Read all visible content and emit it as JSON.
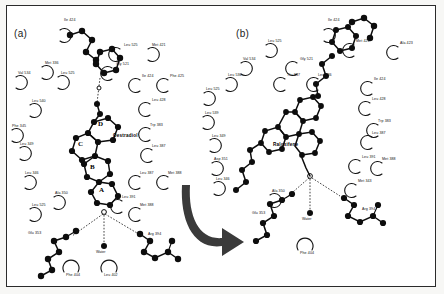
{
  "figure": {
    "type": "ligand-binding-site-diagram",
    "style": "LIGPLOT schematic",
    "background": "#ffffff",
    "frame_color": "#2b2b2b",
    "arrow": {
      "name": "transition-arrow",
      "color": "#3a3a3a",
      "description": "curved arrow from panel a to panel b"
    }
  },
  "panels": [
    {
      "id": "a",
      "label": "(a)",
      "ligand": {
        "name": "Oestradiol",
        "rings": [
          "D",
          "C",
          "B",
          "A"
        ]
      },
      "water": "Water",
      "residues": [
        {
          "label": "Ile 424",
          "x": 64,
          "y": 19
        },
        {
          "label": "Leu 525",
          "x": 124,
          "y": 44
        },
        {
          "label": "Met 421",
          "x": 152,
          "y": 44
        },
        {
          "label": "Met 336",
          "x": 45,
          "y": 62
        },
        {
          "label": "Gly 521",
          "x": 116,
          "y": 63
        },
        {
          "label": "Val 534",
          "x": 18,
          "y": 72
        },
        {
          "label": "Leu 525",
          "x": 61,
          "y": 72
        },
        {
          "label": "Ile 424",
          "x": 142,
          "y": 75
        },
        {
          "label": "Phe 425",
          "x": 170,
          "y": 75
        },
        {
          "label": "Leu 540",
          "x": 32,
          "y": 100
        },
        {
          "label": "Leu 428",
          "x": 152,
          "y": 99
        },
        {
          "label": "Phe 345",
          "x": 12,
          "y": 125
        },
        {
          "label": "Trp 383",
          "x": 150,
          "y": 124
        },
        {
          "label": "Leu 349",
          "x": 20,
          "y": 143
        },
        {
          "label": "Leu 387",
          "x": 152,
          "y": 145
        },
        {
          "label": "Leu 346",
          "x": 25,
          "y": 172
        },
        {
          "label": "Leu 387",
          "x": 140,
          "y": 172
        },
        {
          "label": "Met 388",
          "x": 168,
          "y": 172
        },
        {
          "label": "Ala 350",
          "x": 55,
          "y": 192
        },
        {
          "label": "Leu 391",
          "x": 122,
          "y": 196
        },
        {
          "label": "Leu 525",
          "x": 32,
          "y": 204
        },
        {
          "label": "Met 388",
          "x": 140,
          "y": 204
        },
        {
          "label": "Glu 353",
          "x": 28,
          "y": 232
        },
        {
          "label": "Arg 394",
          "x": 148,
          "y": 233
        },
        {
          "label": "Phe 404",
          "x": 66,
          "y": 274
        },
        {
          "label": "Leu 402",
          "x": 104,
          "y": 274
        }
      ]
    },
    {
      "id": "b",
      "label": "(b)",
      "ligand": {
        "name": "Raloxifene",
        "rings": []
      },
      "water": "Water",
      "residues": [
        {
          "label": "Ile 424",
          "x": 328,
          "y": 19
        },
        {
          "label": "Leu 525",
          "x": 268,
          "y": 40
        },
        {
          "label": "Met 421",
          "x": 356,
          "y": 40
        },
        {
          "label": "Ala 423",
          "x": 400,
          "y": 42
        },
        {
          "label": "Val 534",
          "x": 243,
          "y": 58
        },
        {
          "label": "Gly 521",
          "x": 300,
          "y": 58
        },
        {
          "label": "Leu 536",
          "x": 228,
          "y": 74
        },
        {
          "label": "Thr 347",
          "x": 287,
          "y": 74
        },
        {
          "label": "Leu 346",
          "x": 318,
          "y": 74
        },
        {
          "label": "Ile 424",
          "x": 374,
          "y": 78
        },
        {
          "label": "Leu 525",
          "x": 206,
          "y": 88
        },
        {
          "label": "Leu 428",
          "x": 372,
          "y": 98
        },
        {
          "label": "Leu 539",
          "x": 205,
          "y": 112
        },
        {
          "label": "Trp 383",
          "x": 378,
          "y": 120
        },
        {
          "label": "Leu 349",
          "x": 212,
          "y": 135
        },
        {
          "label": "Leu 387",
          "x": 372,
          "y": 132
        },
        {
          "label": "Asp 351",
          "x": 214,
          "y": 158
        },
        {
          "label": "Leu 391",
          "x": 362,
          "y": 156
        },
        {
          "label": "Met 388",
          "x": 382,
          "y": 158
        },
        {
          "label": "Leu 346",
          "x": 216,
          "y": 178
        },
        {
          "label": "Met 343",
          "x": 358,
          "y": 180
        },
        {
          "label": "Ala 350",
          "x": 272,
          "y": 190
        },
        {
          "label": "Glu 353",
          "x": 252,
          "y": 212
        },
        {
          "label": "Arg 394",
          "x": 362,
          "y": 208
        },
        {
          "label": "Phe 404",
          "x": 300,
          "y": 252
        }
      ]
    }
  ]
}
